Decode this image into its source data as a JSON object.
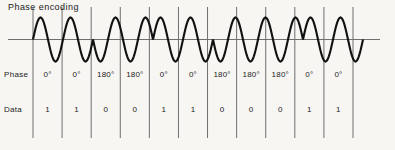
{
  "title": "Phase encoding",
  "rows": {
    "phase_label": "Phase",
    "data_label": "Data"
  },
  "colors": {
    "waveform": "#111111",
    "axis": "#6e6e6e",
    "divider": "#6e6e6e",
    "text": "#1a1a1a",
    "background": "#f7f6f3"
  },
  "columns": [
    {
      "phase": "0°",
      "data": "1"
    },
    {
      "phase": "0°",
      "data": "1"
    },
    {
      "phase": "180°",
      "data": "0"
    },
    {
      "phase": "180°",
      "data": "0"
    },
    {
      "phase": "0°",
      "data": "1"
    },
    {
      "phase": "0°",
      "data": "1"
    },
    {
      "phase": "180°",
      "data": "0"
    },
    {
      "phase": "180°",
      "data": "0"
    },
    {
      "phase": "180°",
      "data": "0"
    },
    {
      "phase": "0°",
      "data": "1"
    },
    {
      "phase": "0°",
      "data": "1"
    }
  ],
  "chart_data": {
    "type": "line",
    "title": "Phase encoding",
    "xlabel": "",
    "ylabel": "",
    "grid": true,
    "legend": null,
    "series": [
      {
        "name": "carrier",
        "phase_degrees": [
          0,
          0,
          180,
          180,
          0,
          0,
          180,
          180,
          180,
          0,
          0
        ],
        "bits": [
          1,
          1,
          0,
          0,
          1,
          1,
          0,
          0,
          0,
          1,
          1
        ],
        "cycles_per_bit": 1,
        "amplitude": 1,
        "baseline": 0
      }
    ],
    "categories": [
      "1",
      "1",
      "0",
      "0",
      "1",
      "1",
      "0",
      "0",
      "0",
      "1",
      "1"
    ]
  },
  "geometry": {
    "grid_left": 33,
    "grid_right": 353,
    "grid_top": 55,
    "grid_bottom": 138,
    "axis_y": 39.5,
    "axis_x_start": 8,
    "axis_x_end": 380,
    "wave_x_start": 33,
    "wave_x_end": 363,
    "amplitude_px": 22
  }
}
